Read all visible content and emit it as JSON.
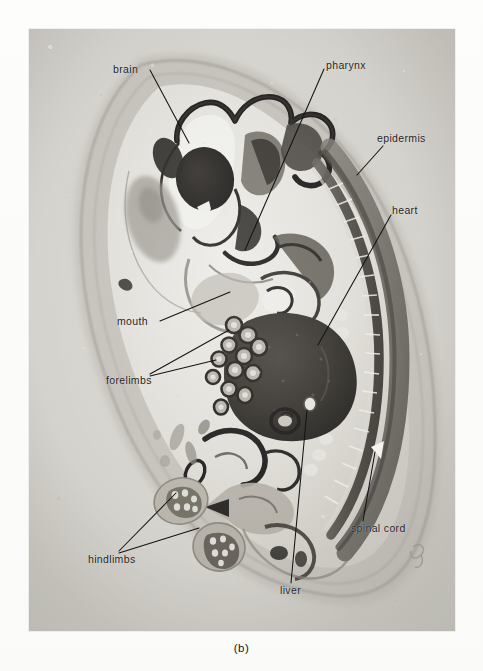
{
  "figure": {
    "panel_caption": "(b)",
    "kind": "photomicrograph",
    "border_color": "#9a978f",
    "photo_base_color": "#cfcdc7",
    "label_color": "#1b1b1b",
    "leader_color": "#141414"
  },
  "labels": [
    {
      "id": "brain",
      "text": "brain",
      "x": 113,
      "y": 63,
      "align": "left",
      "leader": {
        "from": [
          150,
          70
        ],
        "to": [
          189,
          143
        ]
      }
    },
    {
      "id": "pharynx",
      "text": "pharynx",
      "x": 326,
      "y": 59,
      "align": "left",
      "leader": {
        "from": [
          324,
          69
        ],
        "to": [
          245,
          250
        ]
      }
    },
    {
      "id": "epidermis",
      "text": "epidermis",
      "x": 377,
      "y": 132,
      "align": "left",
      "leader": {
        "from": [
          383,
          146
        ],
        "to": [
          357,
          175
        ]
      }
    },
    {
      "id": "heart",
      "text": "heart",
      "x": 392,
      "y": 204,
      "align": "left",
      "leader": {
        "from": [
          391,
          215
        ],
        "to": [
          318,
          345
        ]
      }
    },
    {
      "id": "mouth",
      "text": "mouth",
      "x": 117,
      "y": 315,
      "align": "left",
      "leader": {
        "from": [
          160,
          321
        ],
        "to": [
          230,
          292
        ]
      }
    },
    {
      "id": "forelimbs",
      "text": "forelimbs",
      "x": 106,
      "y": 374,
      "align": "left",
      "leaders": [
        {
          "from": [
            150,
            374
          ],
          "to": [
            229,
            330
          ]
        },
        {
          "from": [
            150,
            376
          ],
          "to": [
            216,
            360
          ]
        }
      ]
    },
    {
      "id": "hindlimbs",
      "text": "hindlimbs",
      "x": 88,
      "y": 553,
      "align": "left",
      "leaders": [
        {
          "from": [
            119,
            551
          ],
          "to": [
            176,
            493
          ]
        },
        {
          "from": [
            119,
            553
          ],
          "to": [
            199,
            528
          ]
        }
      ]
    },
    {
      "id": "liver",
      "text": "liver",
      "x": 280,
      "y": 584,
      "align": "left",
      "leader": {
        "from": [
          291,
          583
        ],
        "to": [
          307,
          410
        ]
      }
    },
    {
      "id": "spinal cord",
      "text": "spinal cord",
      "x": 351,
      "y": 522,
      "align": "left",
      "leader": {
        "from": [
          363,
          521
        ],
        "to": [
          375,
          452
        ]
      }
    }
  ],
  "photo_frame": {
    "left": 29,
    "top": 29,
    "width": 426,
    "height": 602
  }
}
